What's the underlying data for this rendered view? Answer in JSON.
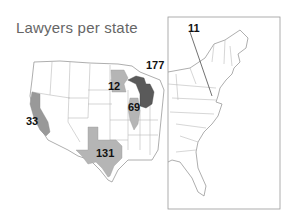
{
  "title": "Lawyers per state",
  "colors": {
    "light_fill": "#b5b5b5",
    "mid_fill": "#999999",
    "dark_fill": "#5a5a5a",
    "border": "#bbbbbb",
    "inset_frame": "#999999"
  },
  "states": [
    {
      "state": "California",
      "value": "33",
      "shade": "mid"
    },
    {
      "state": "Texas",
      "value": "131",
      "shade": "light"
    },
    {
      "state": "Minnesota",
      "value": "12",
      "shade": "light"
    },
    {
      "state": "Illinois",
      "value": "69",
      "shade": "light"
    },
    {
      "state": "Michigan",
      "value": "177",
      "shade": "dark"
    },
    {
      "state": "Delaware / Maryland (inset)",
      "value": "11",
      "shade": "light"
    }
  ],
  "inset": {
    "label": "Eastern US inset"
  }
}
